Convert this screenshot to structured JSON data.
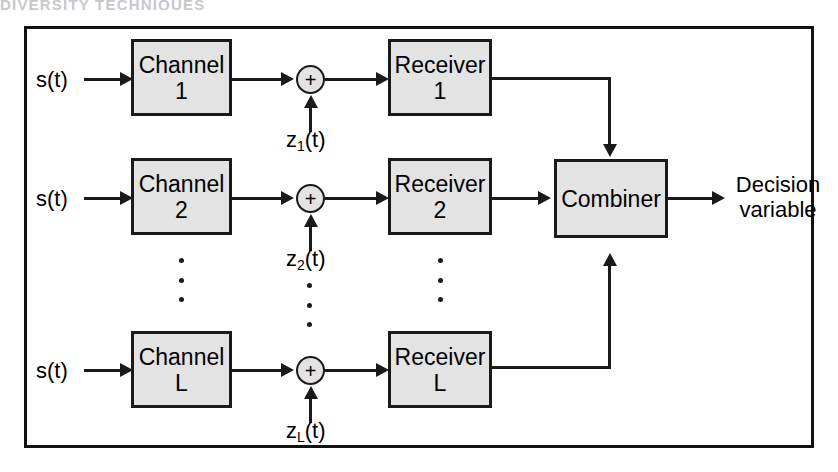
{
  "page": {
    "cut_off_heading": "DIVERSITY TECHNIQUES",
    "width": 838,
    "height": 472,
    "background": "#ffffff"
  },
  "diagram": {
    "type": "block-diagram",
    "colors": {
      "box_fill": "#e3e3e3",
      "stroke": "#1a1a1a",
      "frame": "#121212",
      "text": "#000000"
    },
    "branches": [
      {
        "input_label": "s(t)",
        "channel": {
          "line1": "Channel",
          "line2": "1"
        },
        "adder": "+",
        "noise_label_base": "z",
        "noise_label_sub": "1",
        "noise_label_tail": "(t)",
        "receiver": {
          "line1": "Receiver",
          "line2": "1"
        }
      },
      {
        "input_label": "s(t)",
        "channel": {
          "line1": "Channel",
          "line2": "2"
        },
        "adder": "+",
        "noise_label_base": "z",
        "noise_label_sub": "2",
        "noise_label_tail": "(t)",
        "receiver": {
          "line1": "Receiver",
          "line2": "2"
        }
      },
      {
        "input_label": "s(t)",
        "channel": {
          "line1": "Channel",
          "line2": "L"
        },
        "adder": "+",
        "noise_label_base": "z",
        "noise_label_sub": "L",
        "noise_label_tail": "(t)",
        "receiver": {
          "line1": "Receiver",
          "line2": "L"
        }
      }
    ],
    "combiner": {
      "label": "Combiner"
    },
    "output": {
      "line1": "Decision",
      "line2": "variable"
    },
    "ellipsis": {
      "glyph": "vertical-dots",
      "count": 3,
      "columns": 3
    }
  }
}
